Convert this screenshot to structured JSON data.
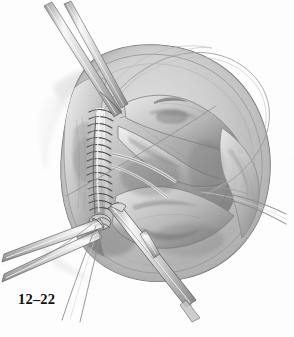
{
  "figure": {
    "caption": "12–22",
    "domain": "medical-surgical-illustration",
    "medium": "graphite pencil rendering, grayscale halftone",
    "background_color": "#ffffff",
    "canvas": {
      "width": 294,
      "height": 337
    },
    "palette": {
      "paper": "#ffffff",
      "lightest_tissue": "#f2f2f2",
      "light_tissue": "#dcdcdc",
      "mid_tissue": "#b4b4b4",
      "shadow_tissue": "#8a8a8a",
      "deep_shadow": "#5c5c5c",
      "darkest": "#2e2e2e",
      "outline": "#4a4a4a",
      "thread_line": "#777777",
      "instrument_metal": "#cfcfcf",
      "instrument_edge": "#5a5a5a",
      "caption_text": "#111111"
    },
    "parts": [
      {
        "name": "kidney-body",
        "label": "Kidney (bean-shaped organ, bivalved)",
        "center": [
          168,
          163
        ],
        "radius_x": 104,
        "radius_y": 113,
        "tone": "#c8c8c8"
      },
      {
        "name": "capsule-rim",
        "label": "Renal capsule outer rim",
        "tone": "#9a9a9a"
      },
      {
        "name": "suture-line",
        "label": "Running (continuous) suture closure",
        "stitch_count": 17,
        "x": 96,
        "y_start": 110,
        "y_end": 215,
        "tone": "#eeeeee"
      },
      {
        "name": "renal-pelvis",
        "label": "Opened renal pelvis / collecting system",
        "tone": "#a8a8a8"
      },
      {
        "name": "calyx-upper",
        "label": "Upper calyx",
        "tone": "#b0b0b0"
      },
      {
        "name": "calyx-lower",
        "label": "Lower calyx",
        "tone": "#aaaaaa"
      },
      {
        "name": "forceps-upper-left",
        "label": "Fine forceps entering from upper left",
        "tone": "#d5d5d5"
      },
      {
        "name": "forceps-lower-left",
        "label": "Forceps entering from lower left",
        "tone": "#d5d5d5"
      },
      {
        "name": "instrument-lower-center",
        "label": "Instrument shaft descending to lower right",
        "tone": "#d8d8d8"
      },
      {
        "name": "suture-thread-arc",
        "label": "Long suture thread arcing over the top",
        "tone": "#8e8e8e"
      },
      {
        "name": "suture-thread-right",
        "label": "Suture thread tails exiting right",
        "tone": "#8e8e8e"
      }
    ]
  }
}
